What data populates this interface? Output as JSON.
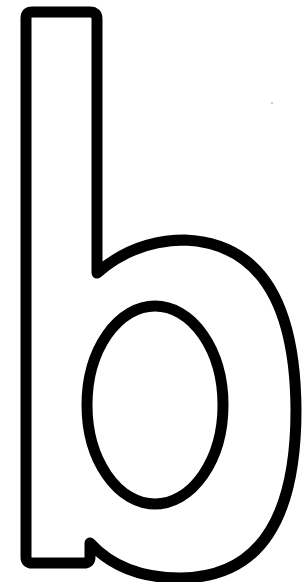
{
  "figure": {
    "letter": "b",
    "style": "outline",
    "stroke_color": "#000000",
    "fill_color": "#ffffff",
    "background": "#ffffff"
  }
}
